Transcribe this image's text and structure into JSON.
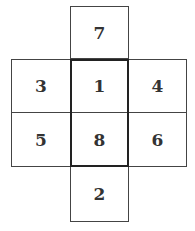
{
  "diagram": {
    "type": "cube-net",
    "cells": [
      {
        "id": "top",
        "label": "7",
        "x": 70,
        "y": 6,
        "w": 59,
        "h": 53
      },
      {
        "id": "row1-left",
        "label": "3",
        "x": 11,
        "y": 59,
        "w": 60,
        "h": 54
      },
      {
        "id": "row1-center",
        "label": "1",
        "x": 70,
        "y": 59,
        "w": 59,
        "h": 54
      },
      {
        "id": "row1-right",
        "label": "4",
        "x": 128,
        "y": 59,
        "w": 59,
        "h": 54
      },
      {
        "id": "row2-left",
        "label": "5",
        "x": 11,
        "y": 112,
        "w": 60,
        "h": 55
      },
      {
        "id": "row2-center",
        "label": "8",
        "x": 70,
        "y": 112,
        "w": 59,
        "h": 55
      },
      {
        "id": "row2-right",
        "label": "6",
        "x": 128,
        "y": 112,
        "w": 59,
        "h": 55
      },
      {
        "id": "bottom",
        "label": "2",
        "x": 70,
        "y": 166,
        "w": 59,
        "h": 56
      }
    ],
    "highlight": {
      "x": 70,
      "y": 59,
      "w": 59,
      "h": 108
    }
  }
}
